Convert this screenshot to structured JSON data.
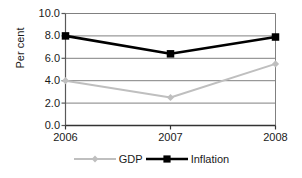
{
  "chart_data": {
    "type": "line",
    "title": "",
    "xlabel": "",
    "ylabel": "Per cent",
    "categories": [
      "2006",
      "2007",
      "2008"
    ],
    "x_tick_labels": [
      "2006",
      "2007",
      "2008"
    ],
    "y_tick_labels": [
      "0.0",
      "2.0",
      "4.0",
      "6.0",
      "8.0",
      "10.0"
    ],
    "y_tick_values": [
      0.0,
      2.0,
      4.0,
      6.0,
      8.0,
      10.0
    ],
    "ylim": [
      0.0,
      10.0
    ],
    "grid": true,
    "legend_position": "bottom",
    "series": [
      {
        "name": "GDP",
        "values": [
          4.0,
          2.5,
          5.5
        ],
        "color": "#bfbfbf",
        "marker": "diamond"
      },
      {
        "name": "Inflation",
        "values": [
          8.0,
          6.4,
          7.9
        ],
        "color": "#000000",
        "marker": "square"
      }
    ]
  },
  "legend": {
    "items": [
      {
        "label": "GDP"
      },
      {
        "label": "Inflation"
      }
    ]
  },
  "axes": {
    "y_title": "Per cent"
  }
}
